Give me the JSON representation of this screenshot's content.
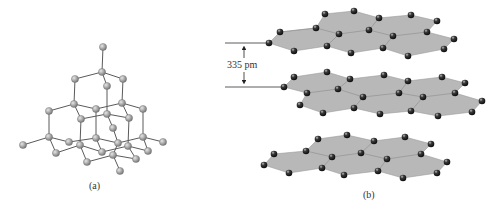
{
  "figure": {
    "panel_a": {
      "label": "(a)",
      "description": "diamond lattice",
      "atom_color": "#a9a9a9",
      "bond_color": "#555555"
    },
    "panel_b": {
      "label": "(b)",
      "description": "graphite layers",
      "sheet_color": "#b5b5b5",
      "atom_color": "#2a2a2a",
      "spacing_label": "335 pm"
    }
  }
}
